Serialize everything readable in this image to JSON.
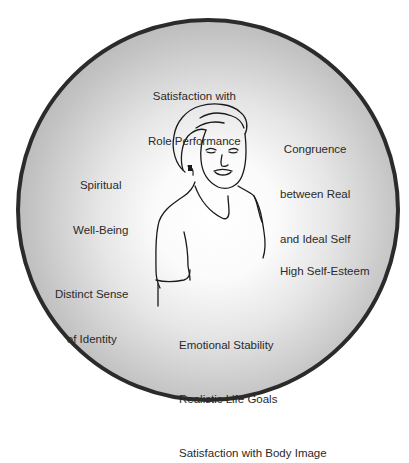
{
  "diagram": {
    "labels": {
      "role_performance": [
        "Satisfaction with",
        "Role Performance"
      ],
      "congruence": [
        "Congruence",
        "between Real",
        "and Ideal Self"
      ],
      "spiritual": [
        "Spiritual",
        "Well-Being"
      ],
      "self_esteem": [
        "High Self-Esteem"
      ],
      "identity": [
        "Distinct Sense",
        "of Identity"
      ],
      "bottom_list": [
        "Emotional Stability",
        "Realistic Life Goals",
        "Satisfaction with Body Image"
      ]
    },
    "colors": {
      "circle_border": "#2b2b2b",
      "circle_fill_center": "#ffffff",
      "circle_fill_edge": "#a2a2a2",
      "text": "#2a2a2a",
      "line_art": "#1a1a1a"
    }
  }
}
